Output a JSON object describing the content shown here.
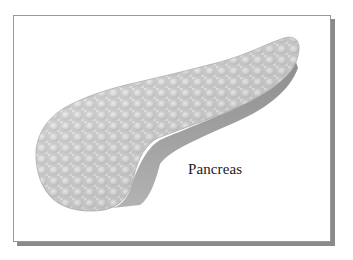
{
  "figure": {
    "label": "Pancreas"
  },
  "colors": {
    "frame_border": "#9a9a9a",
    "frame_shadow": "#8a8a8a",
    "organ_fill": "#d2d2d2",
    "organ_highlight": "#ececec",
    "organ_underside": "#9c9c9c",
    "label_text": "#1a1a1a"
  }
}
